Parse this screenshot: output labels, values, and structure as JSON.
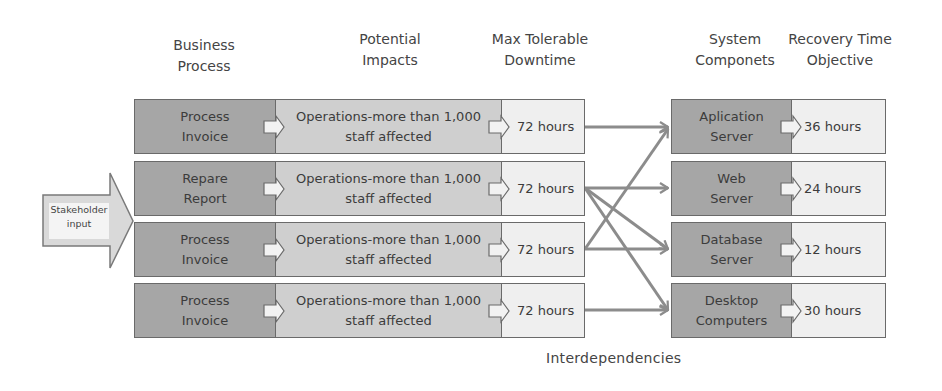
{
  "headers": {
    "business_process": "Business\nProcess",
    "potential_impacts": "Potential\nImpacts",
    "max_tolerable_downtime": "Max Tolerable\nDowntime",
    "system_components": "System\nComponets",
    "recovery_time_objective": "Recovery Time\nObjective"
  },
  "stakeholder": {
    "label": "Stakeholder\ninput"
  },
  "process_rows": [
    {
      "process": "Process\nInvoice",
      "impact": "Operations-more than 1,000\nstaff affected",
      "mtd": "72 hours"
    },
    {
      "process": "Repare\nReport",
      "impact": "Operations-more than 1,000\nstaff affected",
      "mtd": "72 hours"
    },
    {
      "process": "Process\nInvoice",
      "impact": "Operations-more than 1,000\nstaff affected",
      "mtd": "72 hours"
    },
    {
      "process": "Process\nInvoice",
      "impact": "Operations-more than 1,000\nstaff affected",
      "mtd": "72 hours"
    }
  ],
  "component_rows": [
    {
      "component": "Aplication\nServer",
      "rto": "36 hours"
    },
    {
      "component": "Web\nServer",
      "rto": "24 hours"
    },
    {
      "component": "Database\nServer",
      "rto": "12 hours"
    },
    {
      "component": "Desktop\nComputers",
      "rto": "30 hours"
    }
  ],
  "links": [
    {
      "from_row": 1,
      "to_component": 1
    },
    {
      "from_row": 2,
      "to_component": 2
    },
    {
      "from_row": 2,
      "to_component": 3
    },
    {
      "from_row": 2,
      "to_component": 4
    },
    {
      "from_row": 3,
      "to_component": 1
    },
    {
      "from_row": 3,
      "to_component": 3
    },
    {
      "from_row": 4,
      "to_component": 4
    }
  ],
  "footer": {
    "label": "Interdependencies"
  },
  "colors": {
    "dark": "#a6a6a6",
    "mid": "#cfcfcf",
    "light": "#efefef",
    "border": "#6a6a6a",
    "link": "#8c8c8c"
  }
}
